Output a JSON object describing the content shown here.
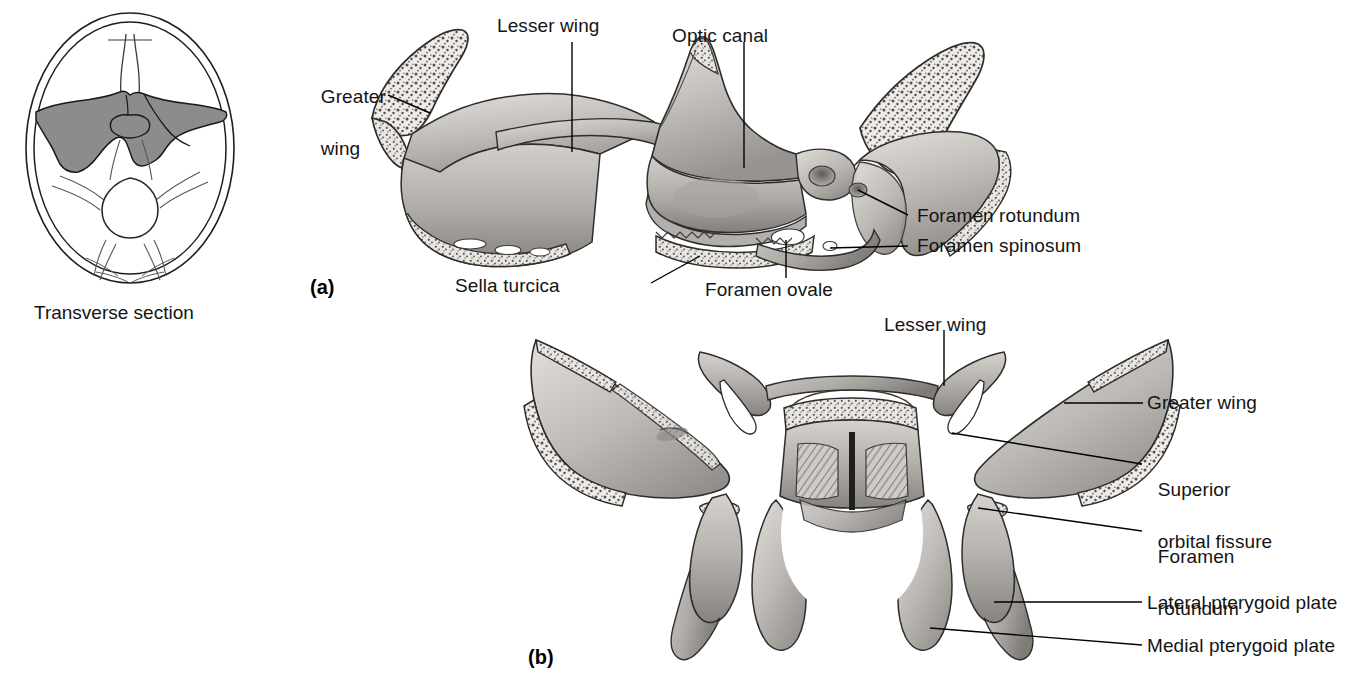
{
  "figure": {
    "type": "anatomical-illustration"
  },
  "orientation_panel": {
    "caption": "Transverse section",
    "shaded_region_name": "sphenoid-bone-shaded",
    "colors": {
      "shade": "#8c8c8c",
      "outline": "#1a1a1a"
    }
  },
  "panel_a": {
    "id": "(a)",
    "view": "superior view",
    "labels": [
      {
        "key": "greater_wing",
        "text": "Greater\nwing",
        "line1": "Greater",
        "line2": "wing"
      },
      {
        "key": "lesser_wing",
        "text": "Lesser wing"
      },
      {
        "key": "optic_canal",
        "text": "Optic canal"
      },
      {
        "key": "foramen_rotundum",
        "text": "Foramen rotundum"
      },
      {
        "key": "foramen_spinosum",
        "text": "Foramen spinosum"
      },
      {
        "key": "foramen_ovale",
        "text": "Foramen ovale"
      },
      {
        "key": "sella_turcica",
        "text": "Sella turcica"
      }
    ]
  },
  "panel_b": {
    "id": "(b)",
    "view": "posterior view",
    "labels": [
      {
        "key": "lesser_wing",
        "text": "Lesser wing"
      },
      {
        "key": "greater_wing",
        "text": "Greater wing"
      },
      {
        "key": "superior_orbital_fissure",
        "line1": "Superior",
        "line2": "orbital fissure"
      },
      {
        "key": "foramen_rotundum",
        "line1": "Foramen",
        "line2": "rotundum"
      },
      {
        "key": "lateral_pterygoid_plate",
        "text": "Lateral pterygoid plate"
      },
      {
        "key": "medial_pterygoid_plate",
        "text": "Medial pterygoid plate"
      }
    ]
  },
  "colors": {
    "bone_light": "#d9d6d2",
    "bone_mid": "#b8b4b0",
    "bone_dark": "#8e8a86",
    "bone_shadow": "#6f6b68",
    "cancellous": "#efece8",
    "stroke": "#2a2a2a",
    "leader": "#000000",
    "text": "#141414",
    "background": "#ffffff"
  }
}
